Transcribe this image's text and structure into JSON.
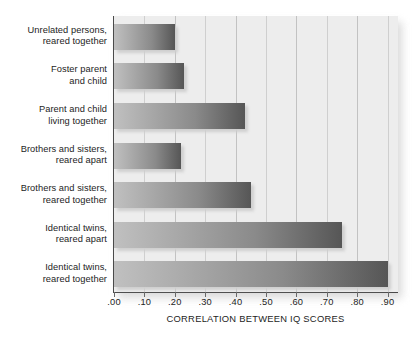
{
  "chart_data": {
    "type": "bar",
    "orientation": "horizontal",
    "title": "",
    "xlabel": "CORRELATION BETWEEN IQ SCORES",
    "ylabel": "",
    "xlim": [
      0.0,
      0.935
    ],
    "xticks": [
      0.0,
      0.1,
      0.2,
      0.3,
      0.4,
      0.5,
      0.6,
      0.7,
      0.8,
      0.9
    ],
    "xticklabels": [
      ".00",
      ".10",
      ".20",
      ".30",
      ".40",
      ".50",
      ".60",
      ".70",
      ".80",
      ".90"
    ],
    "grid": "vertical",
    "legend": "none",
    "categories": [
      "Unrelated persons, reared together",
      "Foster parent and child",
      "Parent and child living together",
      "Brothers and sisters, reared apart",
      "Brothers and sisters, reared together",
      "Identical twins, reared apart",
      "Identical twins, reared together"
    ],
    "values": [
      0.2,
      0.23,
      0.43,
      0.22,
      0.45,
      0.75,
      0.9
    ],
    "bar_gradient_start": "#c0c0c0",
    "bar_gradient_end": "#565656",
    "plot_background": "#ededed",
    "axis_color": "#4a4a4a",
    "gridline_color": "#c2c2c2"
  },
  "y_labels": [
    {
      "line1": "Unrelated persons,",
      "line2": "reared together"
    },
    {
      "line1": "Foster parent",
      "line2": "and child"
    },
    {
      "line1": "Parent and child",
      "line2": "living together"
    },
    {
      "line1": "Brothers and sisters,",
      "line2": "reared apart"
    },
    {
      "line1": "Brothers and sisters,",
      "line2": "reared together"
    },
    {
      "line1": "Identical twins,",
      "line2": "reared apart"
    },
    {
      "line1": "Identical twins,",
      "line2": "reared together"
    }
  ]
}
